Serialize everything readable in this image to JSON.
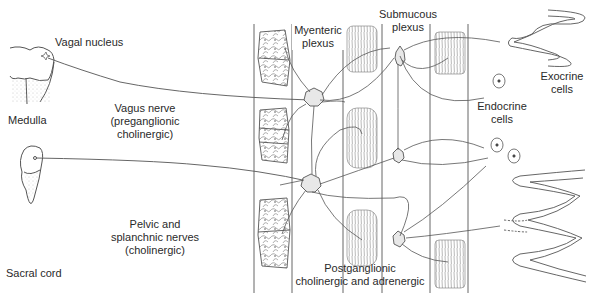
{
  "diagram": {
    "labels": {
      "vagal_nucleus": "Vagal nucleus",
      "medulla": "Medulla",
      "vagus_nerve": [
        "Vagus nerve",
        "(preganglionic",
        "cholinergic)"
      ],
      "sacral_cord": "Sacral cord",
      "pelvic_nerves": [
        "Pelvic and",
        "splanchnic nerves",
        "(cholinergic)"
      ],
      "myenteric_plexus": [
        "Myenteric",
        "plexus"
      ],
      "submucous_plexus": [
        "Submucous",
        "plexus"
      ],
      "exocrine_cells": [
        "Exocrine",
        "cells"
      ],
      "endocrine_cells": [
        "Endocrine",
        "cells"
      ],
      "postganglionic": [
        "Postganglionic",
        "cholinergic and adrenergic"
      ]
    },
    "structures": {
      "cns_sources": [
        "Medulla (vagal nucleus)",
        "Sacral cord"
      ],
      "plexuses": [
        "Myenteric plexus",
        "Submucous plexus"
      ],
      "targets": [
        "Longitudinal muscle",
        "Circular muscle",
        "Exocrine cells",
        "Endocrine cells"
      ]
    },
    "colors": {
      "line": "#555555",
      "text": "#2a2a2a",
      "stipple": "#bdbdbd",
      "background": "#ffffff"
    }
  }
}
